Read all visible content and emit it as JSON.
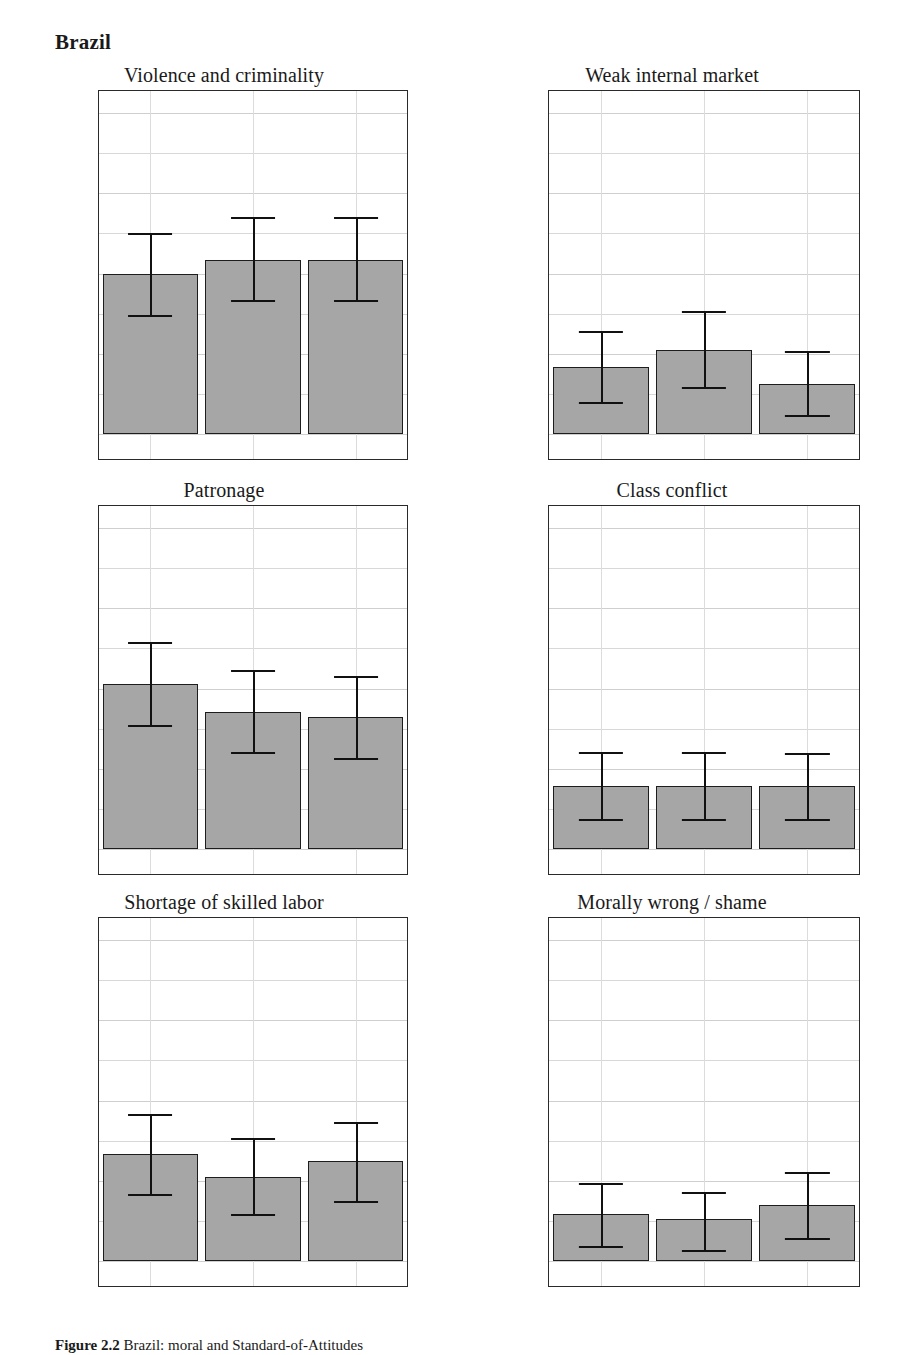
{
  "heading": "Brazil",
  "caption": {
    "label": "Figure 2.2",
    "text": "Brazil: moral and Standard-of-Attitudes"
  },
  "axis": {
    "y_tick_labels": [
      "100%",
      "75%",
      "50%",
      "25%",
      "0%"
    ],
    "y_tick_values": [
      100,
      75,
      50,
      25,
      0
    ],
    "y_minor_values": [
      87.5,
      62.5,
      37.5,
      12.5
    ],
    "ymin": 0,
    "ymax": 100,
    "categories": [
      "Business",
      "Civil Servants",
      "Politicians"
    ]
  },
  "colors": {
    "bar_fill": "#a6a6a6",
    "bar_border": "#1d1d1d",
    "error_bar": "#111111",
    "grid": "#d8d8d8",
    "frame": "#2a2a2a",
    "text": "#1a1a1a"
  },
  "chart_data": [
    {
      "type": "bar",
      "title": "Violence and criminality",
      "xlabel": "",
      "ylabel": "",
      "ylim": [
        0,
        100
      ],
      "grid": true,
      "legend": "none",
      "categories": [
        "Business",
        "Civil Servants",
        "Politicians"
      ],
      "values": [
        49.7,
        54.3,
        54.3
      ],
      "ci_low": [
        37.2,
        41.6,
        41.6
      ],
      "ci_high": [
        62.7,
        67.6,
        67.6
      ]
    },
    {
      "type": "bar",
      "title": "Weak internal market",
      "xlabel": "",
      "ylabel": "",
      "ylim": [
        0,
        100
      ],
      "grid": true,
      "legend": "none",
      "categories": [
        "Business",
        "Civil Servants",
        "Politicians"
      ],
      "values": [
        21.0,
        26.3,
        15.7
      ],
      "ci_low": [
        10.0,
        14.5,
        6.0
      ],
      "ci_high": [
        32.0,
        38.2,
        26.0
      ]
    },
    {
      "type": "bar",
      "title": "Patronage",
      "xlabel": "",
      "ylabel": "",
      "ylim": [
        0,
        100
      ],
      "grid": true,
      "legend": "none",
      "categories": [
        "Business",
        "Civil Servants",
        "Politicians"
      ],
      "values": [
        51.5,
        42.7,
        41.2
      ],
      "ci_low": [
        38.7,
        30.3,
        28.5
      ],
      "ci_high": [
        64.6,
        55.7,
        53.8
      ]
    },
    {
      "type": "bar",
      "title": "Class conflict",
      "xlabel": "",
      "ylabel": "",
      "ylim": [
        0,
        100
      ],
      "grid": true,
      "legend": "none",
      "categories": [
        "Business",
        "Civil Servants",
        "Politicians"
      ],
      "values": [
        19.5,
        19.5,
        19.5
      ],
      "ci_low": [
        9.3,
        9.3,
        9.3
      ],
      "ci_high": [
        30.2,
        30.2,
        30.0
      ]
    },
    {
      "type": "bar",
      "title": "Shortage of skilled labor",
      "xlabel": "",
      "ylabel": "",
      "ylim": [
        0,
        100
      ],
      "grid": true,
      "legend": "none",
      "categories": [
        "Business",
        "Civil Servants",
        "Politicians"
      ],
      "values": [
        33.3,
        26.3,
        31.3
      ],
      "ci_low": [
        20.8,
        14.7,
        18.8
      ],
      "ci_high": [
        45.7,
        38.2,
        43.4
      ]
    },
    {
      "type": "bar",
      "title": "Morally wrong / shame",
      "xlabel": "",
      "ylabel": "",
      "ylim": [
        0,
        100
      ],
      "grid": true,
      "legend": "none",
      "categories": [
        "Business",
        "Civil Servants",
        "Politicians"
      ],
      "values": [
        14.5,
        13.0,
        17.5
      ],
      "ci_low": [
        4.7,
        3.5,
        7.3
      ],
      "ci_high": [
        24.2,
        21.6,
        27.6
      ]
    }
  ]
}
